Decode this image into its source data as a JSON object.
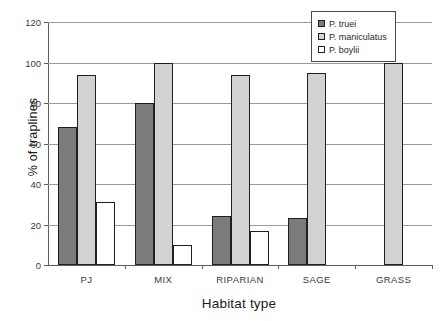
{
  "chart_data": {
    "type": "bar",
    "title": "",
    "xlabel": "Habitat type",
    "ylabel": "% of traplines",
    "categories": [
      "PJ",
      "MIX",
      "RIPARIAN",
      "SAGE",
      "GRASS"
    ],
    "series": [
      {
        "name": "P. truei",
        "color": "#7b7b7b",
        "values": [
          68,
          80,
          24,
          23,
          null
        ]
      },
      {
        "name": "P. maniculatus",
        "color": "#d2d2d2",
        "values": [
          94,
          100,
          94,
          95,
          100
        ]
      },
      {
        "name": "P. boylii",
        "color": "#ffffff",
        "values": [
          31,
          10,
          17,
          null,
          null
        ]
      }
    ],
    "ylim": [
      0,
      120
    ],
    "yticks": [
      0,
      20,
      40,
      60,
      80,
      100,
      120
    ],
    "ytick_labels": [
      "0",
      "20",
      "40",
      "60",
      "80",
      "100",
      "120"
    ],
    "grid": true,
    "grid_axis": "y",
    "legend_position": "top-right"
  },
  "legend": {
    "entries": [
      {
        "label": "P. truei"
      },
      {
        "label": "P. maniculatus"
      },
      {
        "label": "P. boylii"
      }
    ]
  }
}
